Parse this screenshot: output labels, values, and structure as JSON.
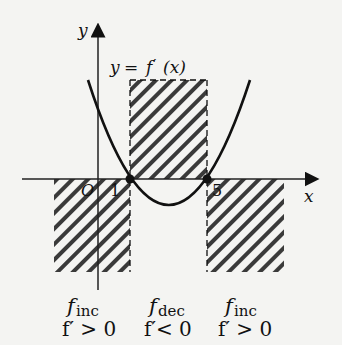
{
  "diagram": {
    "type": "derivative sign chart",
    "axes": {
      "x_label": "x",
      "y_label": "y",
      "origin_label": "O"
    },
    "curve_label": {
      "y": "y",
      "eq": "=",
      "f": "f",
      "prime": "′",
      "arg": "(x)"
    },
    "roots": [
      {
        "label": "1",
        "value": 1
      },
      {
        "label": "5",
        "value": 5
      }
    ],
    "regions": [
      {
        "name": "left",
        "f_label": "f",
        "sub": "inc",
        "cond": "f′ > 0"
      },
      {
        "name": "middle",
        "f_label": "f",
        "sub": "dec",
        "cond": "f′< 0"
      },
      {
        "name": "right",
        "f_label": "f",
        "sub": "inc",
        "cond": "f′ > 0"
      }
    ],
    "colors": {
      "background": "#f4f4f2",
      "ink": "#111111",
      "hatch": "#333333"
    }
  }
}
